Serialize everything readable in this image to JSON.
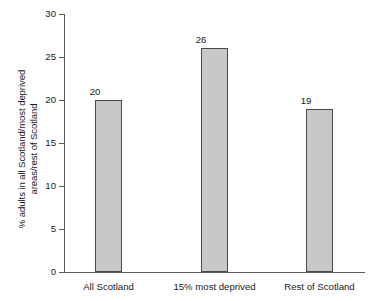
{
  "chart_data": {
    "type": "bar",
    "title": "",
    "xlabel": "",
    "ylabel": "% adults in all Scotland/most deprived areas/rest of Scotland",
    "ylabel_lines": [
      "% adults in all Scotland/most deprived",
      "areas/rest of Scotland"
    ],
    "categories": [
      "All Scotland",
      "15% most deprived",
      "Rest of Scotland"
    ],
    "values": [
      20,
      26,
      19
    ],
    "value_labels": [
      "20",
      "26",
      "19"
    ],
    "ylim": [
      0,
      30
    ],
    "ytick_labels": [
      "0",
      "5",
      "10",
      "15",
      "20",
      "25",
      "30"
    ],
    "ytick_values": [
      0,
      5,
      10,
      15,
      20,
      25,
      30
    ],
    "grid": false,
    "legend": null,
    "colors": {
      "bar_fill": "#c8c8c8",
      "bar_border": "#4a4a4a",
      "axis": "#5a5a5a",
      "text": "#1a1a1a",
      "background": "#ffffff"
    }
  }
}
